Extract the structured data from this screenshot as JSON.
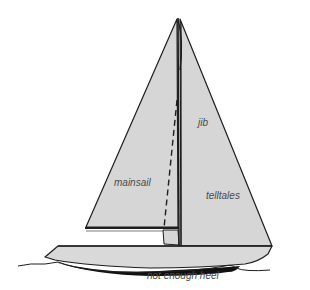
{
  "diagram": {
    "colors": {
      "sail_fill": "#d6d6d6",
      "hull_fill": "#d9d9d9",
      "outline": "#1e1e1e",
      "keel_shadow": "#111111",
      "label_text": "#4a4a4a",
      "background": "#ffffff"
    },
    "labels": {
      "jib": "jib",
      "mainsail": "mainsail",
      "telltales": "telltales",
      "caption": "not enough heel"
    }
  }
}
